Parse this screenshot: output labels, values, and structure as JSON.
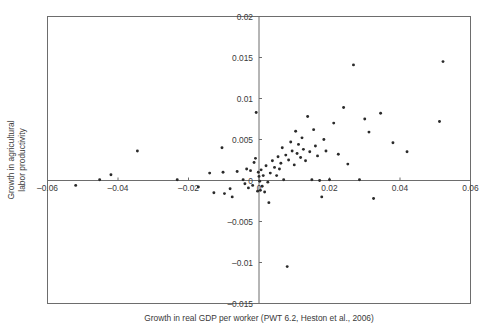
{
  "chart_data": {
    "type": "scatter",
    "title": "",
    "xlabel": "Growth in real GDP per worker (PWT 6.2, Heston et al., 2006)",
    "ylabel_line1": "Growth in agricultural",
    "ylabel_line2": "labor productivity",
    "xlim": [
      -0.06,
      0.06
    ],
    "ylim": [
      -0.015,
      0.02
    ],
    "xticks": [
      -0.06,
      -0.04,
      -0.02,
      0,
      0.02,
      0.04,
      0.06
    ],
    "xticklabels": [
      "–0.06",
      "–0.04",
      "–0.02",
      "0",
      "0.02",
      "0.04",
      "0.06"
    ],
    "yticks": [
      -0.015,
      -0.01,
      -0.005,
      0,
      0.005,
      0.01,
      0.015,
      0.02
    ],
    "yticklabels": [
      "–0.015",
      "–0.01",
      "–0.005",
      "0",
      "0.005",
      "0.01",
      "0.015",
      "0.02"
    ],
    "grid": false,
    "legend": false,
    "marker": "dot",
    "marker_color": "#2a2a2a",
    "axis_color": "#6d6d6d",
    "points": [
      [
        -0.052,
        -0.0006
      ],
      [
        -0.0452,
        0.0001
      ],
      [
        -0.042,
        0.0007
      ],
      [
        -0.0345,
        0.0036
      ],
      [
        -0.0232,
        0.0001
      ],
      [
        -0.0172,
        -0.0008
      ],
      [
        -0.014,
        0.0009
      ],
      [
        -0.0128,
        -0.0015
      ],
      [
        -0.0105,
        0.004
      ],
      [
        -0.0102,
        0.001
      ],
      [
        -0.0098,
        -0.0016
      ],
      [
        -0.0082,
        -0.001
      ],
      [
        -0.0076,
        -0.002
      ],
      [
        -0.0062,
        0.0011
      ],
      [
        -0.0045,
        0.0001
      ],
      [
        -0.004,
        -0.0004
      ],
      [
        -0.0035,
        0.0014
      ],
      [
        -0.003,
        -0.0009
      ],
      [
        -0.0024,
        0.0012
      ],
      [
        -0.0018,
        -0.0006
      ],
      [
        -0.0014,
        0.0022
      ],
      [
        -0.001,
        0.0027
      ],
      [
        -0.0008,
        0.0083
      ],
      [
        -0.0004,
        -0.0013
      ],
      [
        -0.0002,
        0.001
      ],
      [
        0.0,
        0.0005
      ],
      [
        0.0002,
        -0.0001
      ],
      [
        0.0004,
        -0.0012
      ],
      [
        0.0006,
        0.0013
      ],
      [
        0.0009,
        -0.0007
      ],
      [
        0.0012,
        0.0006
      ],
      [
        0.0016,
        -0.0014
      ],
      [
        0.002,
        0.0018
      ],
      [
        0.0025,
        -0.0002
      ],
      [
        0.0028,
        -0.0027
      ],
      [
        0.0032,
        0.0009
      ],
      [
        0.0038,
        0.0024
      ],
      [
        0.0044,
        0.0016
      ],
      [
        0.005,
        0.0006
      ],
      [
        0.0054,
        0.0029
      ],
      [
        0.0058,
        0.0014
      ],
      [
        0.0062,
        0.0021
      ],
      [
        0.0066,
        0.004
      ],
      [
        0.007,
        0.0001
      ],
      [
        0.0076,
        0.0031
      ],
      [
        0.008,
        -0.0105
      ],
      [
        0.0084,
        0.0025
      ],
      [
        0.009,
        0.0047
      ],
      [
        0.0094,
        0.0036
      ],
      [
        0.01,
        0.0019
      ],
      [
        0.0104,
        0.006
      ],
      [
        0.0108,
        0.0033
      ],
      [
        0.0112,
        0.0044
      ],
      [
        0.0118,
        0.0028
      ],
      [
        0.0122,
        0.0052
      ],
      [
        0.0126,
        0.0038
      ],
      [
        0.0132,
        0.0024
      ],
      [
        0.0138,
        0.0078
      ],
      [
        0.0144,
        0.0035
      ],
      [
        0.015,
        0.0001
      ],
      [
        0.0155,
        0.0062
      ],
      [
        0.016,
        0.0042
      ],
      [
        0.0166,
        0.003
      ],
      [
        0.0172,
        0.0
      ],
      [
        0.0178,
        -0.002
      ],
      [
        0.0184,
        0.005
      ],
      [
        0.019,
        0.0036
      ],
      [
        0.02,
        0.0001
      ],
      [
        0.0212,
        0.007
      ],
      [
        0.0225,
        0.0032
      ],
      [
        0.024,
        0.0089
      ],
      [
        0.0252,
        0.002
      ],
      [
        0.0268,
        0.0141
      ],
      [
        0.0285,
        0.0001
      ],
      [
        0.03,
        0.0075
      ],
      [
        0.0312,
        0.0059
      ],
      [
        0.0325,
        -0.0022
      ],
      [
        0.0345,
        0.0082
      ],
      [
        0.038,
        0.0046
      ],
      [
        0.042,
        0.0035
      ],
      [
        0.0512,
        0.0072
      ],
      [
        0.0522,
        0.0145
      ]
    ]
  }
}
